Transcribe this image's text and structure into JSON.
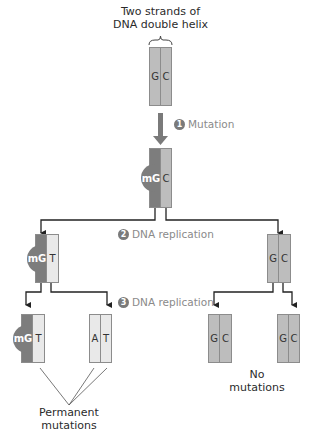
{
  "diagram": {
    "top_label_line1": "Two strands of",
    "top_label_line2": "DNA double helix",
    "steps": [
      {
        "number": "1",
        "label": "Mutation"
      },
      {
        "number": "2",
        "label": "DNA replication"
      },
      {
        "number": "3",
        "label": "DNA replication"
      }
    ],
    "duplexes": {
      "original": {
        "left": "G",
        "right": "C"
      },
      "mutated": {
        "left": "mG",
        "right": "C"
      },
      "gen1_left": {
        "left": "mG",
        "right": "T"
      },
      "gen1_right": {
        "left": "G",
        "right": "C"
      },
      "gen2_a": {
        "left": "mG",
        "right": "T"
      },
      "gen2_b": {
        "left": "A",
        "right": "T"
      },
      "gen2_c": {
        "left": "G",
        "right": "C"
      },
      "gen2_d": {
        "left": "G",
        "right": "C"
      }
    },
    "outcome_labels": {
      "permanent_line1": "Permanent",
      "permanent_line2": "mutations",
      "none": "No mutations"
    },
    "colors": {
      "strand_normal": "#bdbdbd",
      "strand_light": "#e9e9e9",
      "strand_methylated": "#7d7d7d",
      "arrow": "#222222",
      "mutation_arrow": "#7a7a7a",
      "step_text": "#8a8a8a"
    }
  }
}
